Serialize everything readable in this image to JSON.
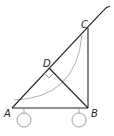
{
  "diagram": {
    "points": {
      "A": {
        "label": "A",
        "x": 12,
        "y": 108
      },
      "B": {
        "label": "B",
        "x": 88,
        "y": 108
      },
      "C": {
        "label": "C",
        "x": 88,
        "y": 28
      },
      "D": {
        "label": "D",
        "x": 49,
        "y": 68
      }
    },
    "labels": {
      "A": "A",
      "B": "B",
      "C": "C",
      "D": "D"
    },
    "colors": {
      "line": "#222222",
      "arc": "#9a9a9a",
      "wheel": "#888888",
      "right_angle_marker": "#888888"
    }
  }
}
